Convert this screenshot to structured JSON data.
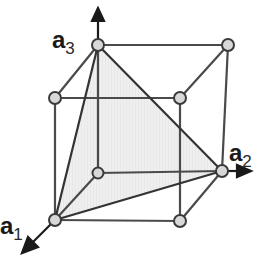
{
  "diagram": {
    "type": "unit cell / cube with lattice plane",
    "colors": {
      "edge": "#4a4a4a",
      "node_fill": "#d8d8d8",
      "node_stroke": "#3a3a3a",
      "plane_fill": "#ececec",
      "arrow": "#1a1a1a"
    },
    "axes": [
      {
        "id": "a1",
        "label": "a",
        "subscript": "1",
        "direction": "front-down-left"
      },
      {
        "id": "a2",
        "label": "a",
        "subscript": "2",
        "direction": "right"
      },
      {
        "id": "a3",
        "label": "a",
        "subscript": "3",
        "direction": "up"
      }
    ],
    "nodes": [
      {
        "id": "origin",
        "x": 98,
        "y": 173
      },
      {
        "id": "a1_tip",
        "x": 55,
        "y": 220
      },
      {
        "id": "a2_tip",
        "x": 222,
        "y": 171
      },
      {
        "id": "a3_tip",
        "x": 98,
        "y": 45
      },
      {
        "id": "back_top_right",
        "x": 228,
        "y": 45
      },
      {
        "id": "front_top_left",
        "x": 55,
        "y": 98
      },
      {
        "id": "front_top_right",
        "x": 180,
        "y": 98
      },
      {
        "id": "front_bottom_right",
        "x": 180,
        "y": 221
      }
    ],
    "shaded_plane": [
      "a1_tip",
      "a2_tip",
      "a3_tip"
    ]
  }
}
